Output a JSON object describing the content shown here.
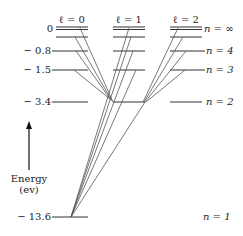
{
  "diagram": {
    "columns": [
      {
        "label": "ℓ = 0",
        "x1": 56,
        "x2": 88
      },
      {
        "label": "ℓ = 1",
        "x1": 113,
        "x2": 145
      },
      {
        "label": "ℓ = 2",
        "x1": 170,
        "x2": 202
      }
    ],
    "energy_labels": [
      {
        "text": "0",
        "y": 29
      },
      {
        "text": "− 0.8",
        "y": 51
      },
      {
        "text": "− 1.5",
        "y": 70
      },
      {
        "text": "− 3.4",
        "y": 102
      },
      {
        "text": "− 13.6",
        "y": 217
      }
    ],
    "n_labels": [
      {
        "text": "n = ∞",
        "y": 29
      },
      {
        "text": "n = 4",
        "y": 51
      },
      {
        "text": "n = 3",
        "y": 70
      },
      {
        "text": "n = 2",
        "y": 102
      },
      {
        "text": "n = 1",
        "y": 217
      }
    ],
    "axis": {
      "label_line1": "Energy",
      "label_line2": "(ev)"
    },
    "colors": {
      "line": "#333333",
      "transition": "#555555"
    }
  }
}
